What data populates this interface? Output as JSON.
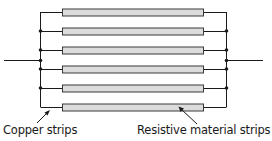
{
  "diagram": {
    "title": "",
    "labels": {
      "copper": "Copper strips",
      "resistive": "Resistive material strips"
    },
    "colors": {
      "line": "#1a1a1a",
      "strip_fill": "#dcdcdc",
      "strip_stroke": "#3a3a3a"
    },
    "strips": [
      {
        "y": 12
      },
      {
        "y": 31
      },
      {
        "y": 50
      },
      {
        "y": 69
      },
      {
        "y": 88
      },
      {
        "y": 107
      }
    ]
  }
}
